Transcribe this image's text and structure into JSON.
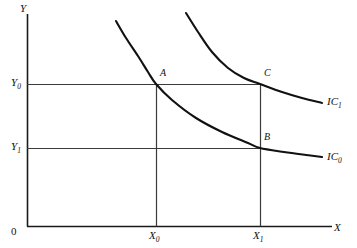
{
  "figure": {
    "background_color": "#ffffff",
    "line_color": "#1a1a1a",
    "curve_color": "#111111",
    "width": 357,
    "height": 248
  },
  "axes": {
    "y_label": "Y",
    "x_label": "X",
    "origin_label": "0",
    "y_axis_x": 27,
    "x_axis_y": 226
  },
  "ticks": {
    "y": [
      {
        "label": "Y",
        "sub": "0",
        "value_y": 84
      },
      {
        "label": "Y",
        "sub": "1",
        "value_y": 148
      }
    ],
    "x": [
      {
        "label": "X",
        "sub": "0",
        "value_x": 156
      },
      {
        "label": "X",
        "sub": "1",
        "value_x": 260
      }
    ]
  },
  "points": [
    {
      "name": "A",
      "x": 156,
      "y": 84
    },
    {
      "name": "B",
      "x": 260,
      "y": 148
    },
    {
      "name": "C",
      "x": 260,
      "y": 84
    }
  ],
  "curves": [
    {
      "name": "IC",
      "sub": "0",
      "label": "IC0"
    },
    {
      "name": "IC",
      "sub": "1",
      "label": "IC1"
    }
  ],
  "chart_data": {
    "type": "line",
    "title": "",
    "xlabel": "X",
    "ylabel": "Y",
    "grid": false,
    "legend": "inline-right",
    "xlim": [
      0,
      1
    ],
    "ylim": [
      0,
      1
    ],
    "axis_ticks": {
      "x": [
        "X0",
        "X1"
      ],
      "y": [
        "Y0",
        "Y1"
      ]
    },
    "series": [
      {
        "name": "IC0",
        "label": "IC₀",
        "description": "Lower indifference curve, convex to origin, passes through points A and B",
        "path_points": [
          [
            116,
            21
          ],
          [
            126,
            38
          ],
          [
            138,
            56
          ],
          [
            148,
            72
          ],
          [
            156,
            84
          ],
          [
            172,
            100
          ],
          [
            196,
            118
          ],
          [
            222,
            132
          ],
          [
            248,
            143
          ],
          [
            260,
            148
          ],
          [
            284,
            152
          ],
          [
            306,
            155
          ],
          [
            322,
            157
          ]
        ]
      },
      {
        "name": "IC1",
        "label": "IC₁",
        "description": "Higher indifference curve, convex to origin, passes through point C",
        "path_points": [
          [
            186,
            13
          ],
          [
            198,
            32
          ],
          [
            212,
            52
          ],
          [
            228,
            68
          ],
          [
            244,
            78
          ],
          [
            260,
            84
          ],
          [
            282,
            92
          ],
          [
            302,
            98
          ],
          [
            322,
            103
          ]
        ]
      }
    ],
    "annotations": [
      {
        "text": "A",
        "x": 156,
        "y": 84,
        "note": "intersection of X0 and Y0 on IC0"
      },
      {
        "text": "B",
        "x": 260,
        "y": 148,
        "note": "intersection of X1 and Y1 on IC0"
      },
      {
        "text": "C",
        "x": 260,
        "y": 84,
        "note": "intersection of X1 and Y0 on IC1"
      }
    ],
    "guide_lines": [
      {
        "type": "horizontal",
        "label": "Y0",
        "from": [
          27,
          84
        ],
        "to": [
          260,
          84
        ]
      },
      {
        "type": "horizontal",
        "label": "Y1",
        "from": [
          27,
          148
        ],
        "to": [
          260,
          148
        ]
      },
      {
        "type": "vertical",
        "label": "X0",
        "from": [
          156,
          84
        ],
        "to": [
          156,
          226
        ]
      },
      {
        "type": "vertical",
        "label": "X1",
        "from": [
          260,
          84
        ],
        "to": [
          260,
          226
        ]
      }
    ]
  }
}
